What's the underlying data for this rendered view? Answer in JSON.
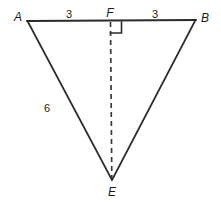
{
  "figure": {
    "type": "geometry-diagram",
    "background_color": "#ffffff",
    "stroke_color": "#2b2b2b",
    "text_color": "#1b1b1b",
    "vertices": [
      {
        "id": "A",
        "label": "A",
        "x": 27,
        "y": 21,
        "label_x": 18,
        "label_y": 17
      },
      {
        "id": "B",
        "label": "B",
        "x": 196,
        "y": 20,
        "label_x": 205,
        "label_y": 18
      },
      {
        "id": "F",
        "label": "F",
        "x": 110,
        "y": 21,
        "label_x": 110,
        "label_y": 13
      },
      {
        "id": "E",
        "label": "E",
        "x": 112,
        "y": 180,
        "label_x": 112,
        "label_y": 192
      }
    ],
    "segments": [
      {
        "id": "AB",
        "from": "A",
        "to": "B",
        "style": "solid"
      },
      {
        "id": "AE",
        "from": "A",
        "to": "E",
        "style": "solid"
      },
      {
        "id": "BE",
        "from": "B",
        "to": "E",
        "style": "solid"
      },
      {
        "id": "FE",
        "from": "F",
        "to": "E",
        "style": "dashed"
      }
    ],
    "measures": [
      {
        "id": "AF",
        "value": "3",
        "x": 69,
        "y": 14
      },
      {
        "id": "FB",
        "value": "3",
        "x": 155,
        "y": 14
      },
      {
        "id": "AE",
        "value": "6",
        "x": 47,
        "y": 108
      }
    ],
    "right_angle": {
      "at": "F",
      "size": 11,
      "x": 110,
      "y": 22
    }
  }
}
